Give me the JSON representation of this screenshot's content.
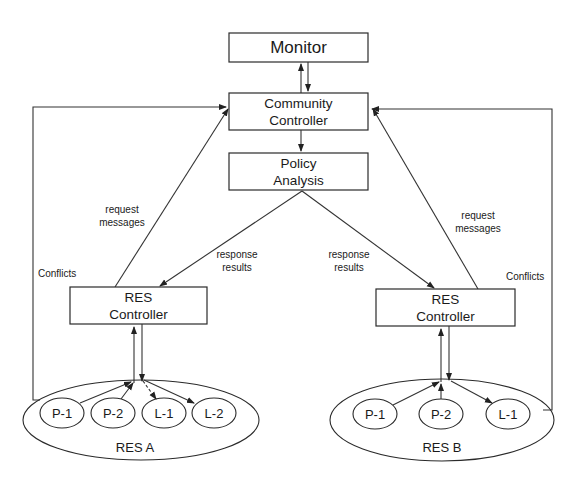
{
  "diagram": {
    "monitor": {
      "label": "Monitor"
    },
    "community_controller": {
      "line1": "Community",
      "line2": "Controller"
    },
    "policy_analysis": {
      "line1": "Policy",
      "line2": "Analysis"
    },
    "res_a": {
      "controller": {
        "line1": "RES",
        "line2": "Controller"
      },
      "group_label": "RES A",
      "nodes": [
        "P-1",
        "P-2",
        "L-1",
        "L-2"
      ],
      "request_label": {
        "line1": "request",
        "line2": "messages"
      },
      "response_label": {
        "line1": "response",
        "line2": "results"
      },
      "conflicts_label": "Conflicts"
    },
    "res_b": {
      "controller": {
        "line1": "RES",
        "line2": "Controller"
      },
      "group_label": "RES B",
      "nodes": [
        "P-1",
        "P-2",
        "L-1"
      ],
      "request_label": {
        "line1": "request",
        "line2": "messages"
      },
      "response_label": {
        "line1": "response",
        "line2": "results"
      },
      "conflicts_label": "Conflicts"
    }
  },
  "colors": {
    "stroke": "#2a2a2a",
    "background": "#ffffff",
    "text": "#1a1a1a"
  }
}
